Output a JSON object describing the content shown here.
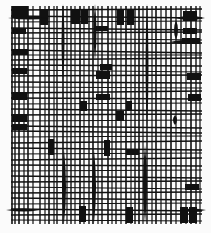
{
  "artwork": {
    "background": "#fbfbfb",
    "ink": "#111111",
    "frame": {
      "x0": 11,
      "y0": 6,
      "x1": 202,
      "y1": 224
    },
    "vertical_lines": [
      {
        "x": 12,
        "w": 1.6
      },
      {
        "x": 15,
        "w": 1.4
      },
      {
        "x": 19,
        "w": 1.6
      },
      {
        "x": 24,
        "w": 1.2
      },
      {
        "x": 28,
        "w": 1.6
      },
      {
        "x": 33,
        "w": 1.2
      },
      {
        "x": 40,
        "w": 1.4
      },
      {
        "x": 45,
        "w": 1.2
      },
      {
        "x": 49,
        "w": 1.6
      },
      {
        "x": 54,
        "w": 1.2
      },
      {
        "x": 57,
        "w": 1.4
      },
      {
        "x": 63,
        "w": 1.6
      },
      {
        "x": 67,
        "w": 1.2
      },
      {
        "x": 71,
        "w": 1.4
      },
      {
        "x": 75,
        "w": 1.2
      },
      {
        "x": 80,
        "w": 1.6
      },
      {
        "x": 84,
        "w": 1.2
      },
      {
        "x": 89,
        "w": 1.4
      },
      {
        "x": 93,
        "w": 1.6
      },
      {
        "x": 98,
        "w": 1.2
      },
      {
        "x": 102,
        "w": 1.4
      },
      {
        "x": 108,
        "w": 1.6
      },
      {
        "x": 112,
        "w": 1.2
      },
      {
        "x": 116,
        "w": 1.4
      },
      {
        "x": 121,
        "w": 1.2
      },
      {
        "x": 126,
        "w": 1.6
      },
      {
        "x": 131,
        "w": 1.2
      },
      {
        "x": 135,
        "w": 1.4
      },
      {
        "x": 139,
        "w": 1.6
      },
      {
        "x": 143,
        "w": 1.2
      },
      {
        "x": 147,
        "w": 1.4
      },
      {
        "x": 152,
        "w": 1.2
      },
      {
        "x": 156,
        "w": 1.6
      },
      {
        "x": 161,
        "w": 1.2
      },
      {
        "x": 166,
        "w": 1.4
      },
      {
        "x": 171,
        "w": 1.6
      },
      {
        "x": 176,
        "w": 1.2
      },
      {
        "x": 181,
        "w": 1.4
      },
      {
        "x": 186,
        "w": 1.2
      },
      {
        "x": 191,
        "w": 1.6
      },
      {
        "x": 196,
        "w": 1.4
      },
      {
        "x": 200,
        "w": 1.2
      }
    ],
    "horizontal_lines": [
      {
        "y1": 10,
        "y2": 9,
        "w": 1.4
      },
      {
        "y1": 16,
        "y2": 18,
        "w": 1.6
      },
      {
        "y1": 22,
        "y2": 21,
        "w": 1.2
      },
      {
        "y1": 28,
        "y2": 30,
        "w": 1.4
      },
      {
        "y1": 33,
        "y2": 32,
        "w": 1.6
      },
      {
        "y1": 38,
        "y2": 40,
        "w": 1.2
      },
      {
        "y1": 44,
        "y2": 43,
        "w": 1.6
      },
      {
        "y1": 50,
        "y2": 53,
        "w": 1.4
      },
      {
        "y1": 55,
        "y2": 55,
        "w": 1.2
      },
      {
        "y1": 60,
        "y2": 58,
        "w": 1.6
      },
      {
        "y1": 65,
        "y2": 66,
        "w": 1.4
      },
      {
        "y1": 70,
        "y2": 72,
        "w": 1.2
      },
      {
        "y1": 76,
        "y2": 75,
        "w": 1.6
      },
      {
        "y1": 82,
        "y2": 83,
        "w": 1.4
      },
      {
        "y1": 87,
        "y2": 88,
        "w": 1.2
      },
      {
        "y1": 93,
        "y2": 91,
        "w": 1.6
      },
      {
        "y1": 98,
        "y2": 99,
        "w": 1.4
      },
      {
        "y1": 104,
        "y2": 103,
        "w": 1.2
      },
      {
        "y1": 109,
        "y2": 111,
        "w": 1.6
      },
      {
        "y1": 115,
        "y2": 114,
        "w": 1.4
      },
      {
        "y1": 121,
        "y2": 120,
        "w": 1.2
      },
      {
        "y1": 126,
        "y2": 128,
        "w": 1.6
      },
      {
        "y1": 131,
        "y2": 133,
        "w": 1.4
      },
      {
        "y1": 137,
        "y2": 136,
        "w": 1.2
      },
      {
        "y1": 143,
        "y2": 141,
        "w": 1.6
      },
      {
        "y1": 148,
        "y2": 150,
        "w": 1.4
      },
      {
        "y1": 154,
        "y2": 153,
        "w": 1.2
      },
      {
        "y1": 160,
        "y2": 158,
        "w": 1.6
      },
      {
        "y1": 165,
        "y2": 166,
        "w": 1.4
      },
      {
        "y1": 171,
        "y2": 170,
        "w": 1.2
      },
      {
        "y1": 176,
        "y2": 178,
        "w": 1.6
      },
      {
        "y1": 182,
        "y2": 181,
        "w": 1.4
      },
      {
        "y1": 187,
        "y2": 189,
        "w": 1.2
      },
      {
        "y1": 193,
        "y2": 192,
        "w": 1.6
      },
      {
        "y1": 198,
        "y2": 200,
        "w": 1.4
      },
      {
        "y1": 204,
        "y2": 203,
        "w": 1.2
      },
      {
        "y1": 209,
        "y2": 211,
        "w": 1.6
      },
      {
        "y1": 215,
        "y2": 214,
        "w": 1.4
      },
      {
        "y1": 220,
        "y2": 221,
        "w": 1.2
      }
    ],
    "blocks": [
      {
        "x": 12,
        "y": 6,
        "w": 16,
        "h": 12
      },
      {
        "x": 40,
        "y": 9,
        "w": 8,
        "h": 16
      },
      {
        "x": 71,
        "y": 9,
        "w": 9,
        "h": 15
      },
      {
        "x": 81,
        "y": 9,
        "w": 7,
        "h": 15
      },
      {
        "x": 117,
        "y": 9,
        "w": 7,
        "h": 16
      },
      {
        "x": 127,
        "y": 9,
        "w": 7,
        "h": 16
      },
      {
        "x": 183,
        "y": 11,
        "w": 14,
        "h": 10
      },
      {
        "x": 96,
        "y": 26,
        "w": 12,
        "h": 5
      },
      {
        "x": 183,
        "y": 28,
        "w": 14,
        "h": 6
      },
      {
        "x": 12,
        "y": 28,
        "w": 14,
        "h": 6
      },
      {
        "x": 182,
        "y": 38,
        "w": 18,
        "h": 6
      },
      {
        "x": 12,
        "y": 49,
        "w": 16,
        "h": 6
      },
      {
        "x": 100,
        "y": 64,
        "w": 12,
        "h": 6
      },
      {
        "x": 12,
        "y": 68,
        "w": 15,
        "h": 6
      },
      {
        "x": 96,
        "y": 71,
        "w": 14,
        "h": 8
      },
      {
        "x": 187,
        "y": 73,
        "w": 14,
        "h": 7
      },
      {
        "x": 12,
        "y": 92,
        "w": 15,
        "h": 8
      },
      {
        "x": 96,
        "y": 94,
        "w": 14,
        "h": 6
      },
      {
        "x": 188,
        "y": 94,
        "w": 13,
        "h": 7
      },
      {
        "x": 80,
        "y": 101,
        "w": 7,
        "h": 10
      },
      {
        "x": 126,
        "y": 101,
        "w": 6,
        "h": 10
      },
      {
        "x": 12,
        "y": 114,
        "w": 15,
        "h": 8
      },
      {
        "x": 116,
        "y": 111,
        "w": 8,
        "h": 10
      },
      {
        "x": 12,
        "y": 124,
        "w": 15,
        "h": 6
      },
      {
        "x": 48,
        "y": 139,
        "w": 6,
        "h": 16
      },
      {
        "x": 104,
        "y": 140,
        "w": 6,
        "h": 16
      },
      {
        "x": 126,
        "y": 150,
        "w": 13,
        "h": 5
      },
      {
        "x": 185,
        "y": 184,
        "w": 14,
        "h": 6
      },
      {
        "x": 79,
        "y": 206,
        "w": 7,
        "h": 16
      },
      {
        "x": 126,
        "y": 207,
        "w": 7,
        "h": 16
      },
      {
        "x": 180,
        "y": 207,
        "w": 8,
        "h": 16
      },
      {
        "x": 189,
        "y": 207,
        "w": 8,
        "h": 16
      }
    ],
    "spindles": [
      {
        "x": 63,
        "y0": 4,
        "y1": 80,
        "wmax": 3
      },
      {
        "x": 95,
        "y0": 4,
        "y1": 60,
        "wmax": 3
      },
      {
        "x": 147,
        "y0": 4,
        "y1": 130,
        "wmax": 3
      },
      {
        "x": 176,
        "y0": 20,
        "y1": 40,
        "wmax": 4
      },
      {
        "x": 64,
        "y0": 150,
        "y1": 223,
        "wmax": 4
      },
      {
        "x": 94,
        "y0": 150,
        "y1": 223,
        "wmax": 4
      },
      {
        "x": 145,
        "y0": 145,
        "y1": 223,
        "wmax": 4
      },
      {
        "x": 175,
        "y0": 115,
        "y1": 125,
        "wmax": 4
      }
    ],
    "horizontal_spindles": [
      {
        "y": 18,
        "x0": 8,
        "x1": 50,
        "hmax": 3
      },
      {
        "y": 18,
        "x0": 175,
        "x1": 205,
        "hmax": 4
      },
      {
        "y": 210,
        "x0": 6,
        "x1": 40,
        "hmax": 3
      },
      {
        "y": 210,
        "x0": 180,
        "x1": 206,
        "hmax": 3
      },
      {
        "y": 42,
        "x0": 170,
        "x1": 200,
        "hmax": 4
      }
    ]
  }
}
